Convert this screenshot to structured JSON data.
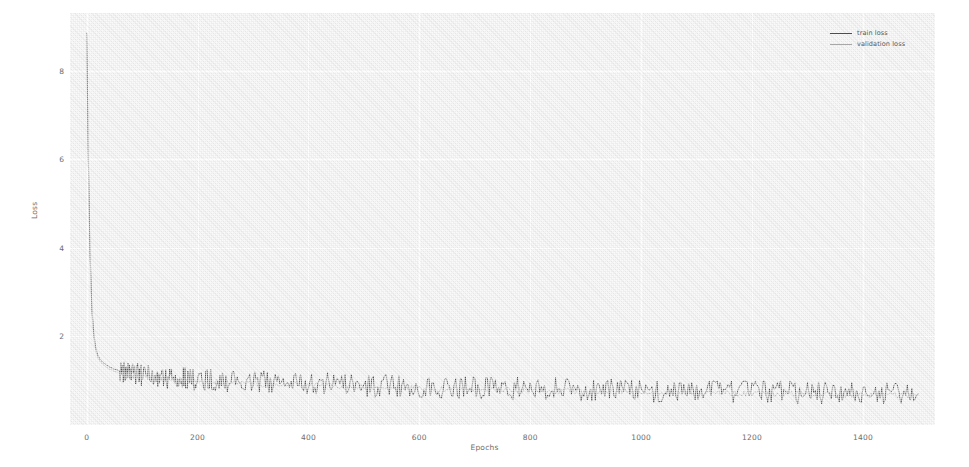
{
  "chart_data": {
    "type": "line",
    "title": "",
    "xlabel": "Epochs",
    "ylabel": "Loss",
    "xlim": [
      -30,
      1530
    ],
    "ylim": [
      0.0,
      9.3
    ],
    "grid": true,
    "legend_position": "top-right",
    "xticks": [
      0,
      200,
      400,
      600,
      800,
      1000,
      1200,
      1400
    ],
    "xtick_labels": [
      "0",
      "200",
      "400",
      "600",
      "800",
      "1000",
      "1200",
      "1400"
    ],
    "yticks": [
      2,
      4,
      6,
      8
    ],
    "ytick_labels": [
      "2",
      "4",
      "6",
      "8"
    ],
    "series": [
      {
        "name": "train loss",
        "color": "#4d4d4d",
        "x": [
          0,
          2,
          4,
          6,
          8,
          10,
          12,
          15,
          18,
          21,
          25,
          30,
          35,
          40,
          50,
          60,
          70,
          80,
          90,
          100,
          120,
          140,
          160,
          180,
          200,
          230,
          260,
          300,
          340,
          380,
          420,
          460,
          500,
          540,
          580,
          620,
          660,
          700,
          740,
          780,
          820,
          860,
          900,
          940,
          980,
          1020,
          1060,
          1100,
          1140,
          1180,
          1220,
          1260,
          1300,
          1340,
          1380,
          1420,
          1460,
          1500
        ],
        "y": [
          8.85,
          7.1,
          5.3,
          4.05,
          3.15,
          2.55,
          2.2,
          1.85,
          1.66,
          1.55,
          1.47,
          1.41,
          1.36,
          1.32,
          1.26,
          1.22,
          1.19,
          1.16,
          1.14,
          1.12,
          1.09,
          1.07,
          1.055,
          1.04,
          1.03,
          1.01,
          0.995,
          0.975,
          0.955,
          0.94,
          0.925,
          0.91,
          0.895,
          0.885,
          0.875,
          0.862,
          0.85,
          0.84,
          0.83,
          0.82,
          0.812,
          0.803,
          0.795,
          0.787,
          0.78,
          0.772,
          0.765,
          0.758,
          0.752,
          0.746,
          0.74,
          0.734,
          0.728,
          0.722,
          0.717,
          0.712,
          0.707,
          0.702
        ]
      },
      {
        "name": "validation loss",
        "color": "#a0a0a0",
        "x": [
          0,
          2,
          4,
          6,
          8,
          10,
          12,
          15,
          18,
          21,
          25,
          30,
          35,
          40,
          50,
          60,
          70,
          80,
          90,
          100,
          120,
          140,
          160,
          180,
          200,
          230,
          260,
          300,
          340,
          380,
          420,
          460,
          500,
          540,
          580,
          620,
          660,
          700,
          740,
          780,
          820,
          860,
          900,
          940,
          980,
          1020,
          1060,
          1100,
          1140,
          1180,
          1220,
          1260,
          1300,
          1340,
          1380,
          1420,
          1460,
          1500
        ],
        "y": [
          8.8,
          7.0,
          5.2,
          3.95,
          3.05,
          2.48,
          2.12,
          1.8,
          1.61,
          1.5,
          1.42,
          1.36,
          1.31,
          1.27,
          1.21,
          1.17,
          1.14,
          1.115,
          1.095,
          1.08,
          1.05,
          1.03,
          1.015,
          1.0,
          0.99,
          0.97,
          0.955,
          0.935,
          0.915,
          0.9,
          0.885,
          0.87,
          0.857,
          0.846,
          0.836,
          0.824,
          0.813,
          0.803,
          0.794,
          0.785,
          0.777,
          0.769,
          0.761,
          0.754,
          0.747,
          0.74,
          0.733,
          0.727,
          0.721,
          0.715,
          0.709,
          0.704,
          0.698,
          0.693,
          0.688,
          0.684,
          0.679,
          0.675
        ]
      }
    ]
  },
  "legend": {
    "items": [
      {
        "label": "train loss",
        "color": "#4d4d4d"
      },
      {
        "label": "validation loss",
        "color": "#a8a8a8"
      }
    ]
  },
  "axes": {
    "x_label": "Epochs",
    "y_label": "Loss"
  },
  "colors": {
    "plot_background": "#ededed",
    "gridline": "#fdfdfd",
    "figure_background": "#ffffff",
    "tick_text": "#6d6d6d",
    "train_line": "#4d4d4d",
    "validation_line": "#a8a8a8"
  }
}
